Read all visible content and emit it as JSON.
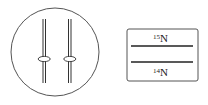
{
  "diagram": {
    "cell": {
      "description": "circle containing two chromosome-like strands with centromere ellipses"
    },
    "density_tube": {
      "top_band_label_sup": "15",
      "top_band_label_base": "N",
      "bottom_band_label_sup": "14",
      "bottom_band_label_base": "N"
    },
    "colors": {
      "stroke": "#333333",
      "background": "#ffffff"
    }
  }
}
